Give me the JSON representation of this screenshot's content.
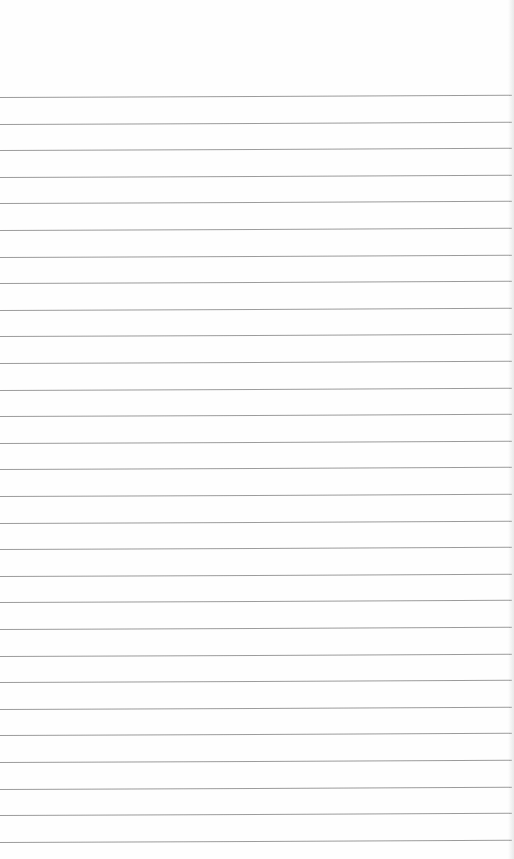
{
  "page": {
    "type": "lined-paper",
    "background_color": "#fefefe",
    "line_color": "#8a8a8a",
    "line_count": 29,
    "first_line_y": 97,
    "line_spacing_px": 26.6,
    "header_text": ""
  }
}
